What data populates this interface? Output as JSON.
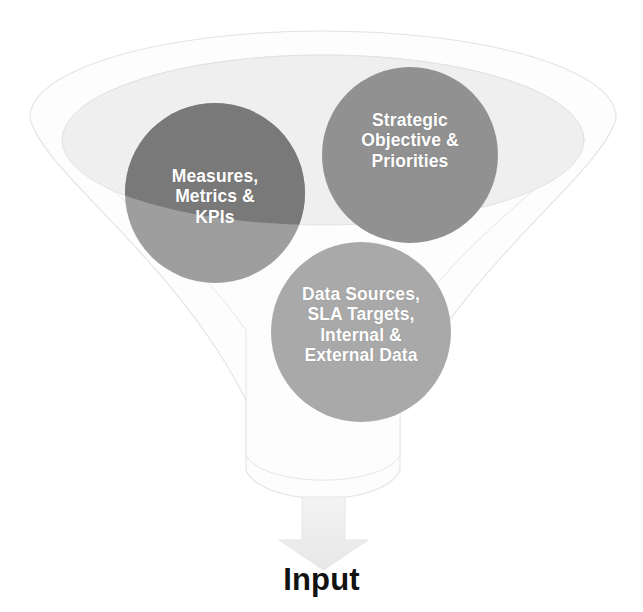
{
  "diagram": {
    "type": "funnel",
    "title": "",
    "caption": "Input",
    "background_color": "#ffffff",
    "funnel": {
      "name": "input-funnel",
      "outer_fill": "#fdfdfd",
      "outer_stroke": "#e2e2e2",
      "inner_ellipse_fill": "#efefef",
      "inner_ellipse_stroke": "#e0e0e0",
      "body_fill": "#fdfdfd"
    },
    "arrow": {
      "name": "down-arrow",
      "direction": "down",
      "fill": "#eeeeee",
      "stroke": "#e4e4e4"
    },
    "bubbles": [
      {
        "id": "measures",
        "label": "Measures,\nMetrics &\nKPIs",
        "fill_top": "#797979",
        "fill_bottom": "#9e9e9e",
        "text_color": "#ffffff",
        "cx": 215,
        "cy": 193,
        "r": 90
      },
      {
        "id": "strategic",
        "label": "Strategic\nObjective &\nPriorities",
        "fill_top": "#919191",
        "fill_bottom": "#919191",
        "text_color": "#ffffff",
        "cx": 410,
        "cy": 155,
        "r": 88
      },
      {
        "id": "datasources",
        "label": "Data Sources,\nSLA Targets,\nInternal &\nExternal Data",
        "fill_top": "#a9a9a9",
        "fill_bottom": "#a9a9a9",
        "text_color": "#ffffff",
        "cx": 361,
        "cy": 332,
        "r": 90
      }
    ]
  }
}
